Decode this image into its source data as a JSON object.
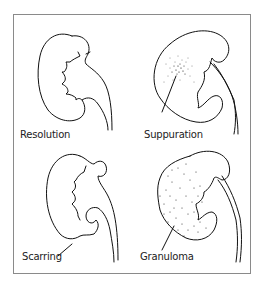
{
  "figure": {
    "panels": [
      {
        "id": "resolution",
        "label": "Resolution"
      },
      {
        "id": "suppuration",
        "label": "Suppuration"
      },
      {
        "id": "scarring",
        "label": "Scarring"
      },
      {
        "id": "granuloma",
        "label": "Granuloma"
      }
    ]
  },
  "colors": {
    "line": "#111111",
    "frame": "#8a8a8a",
    "background": "#ffffff"
  }
}
